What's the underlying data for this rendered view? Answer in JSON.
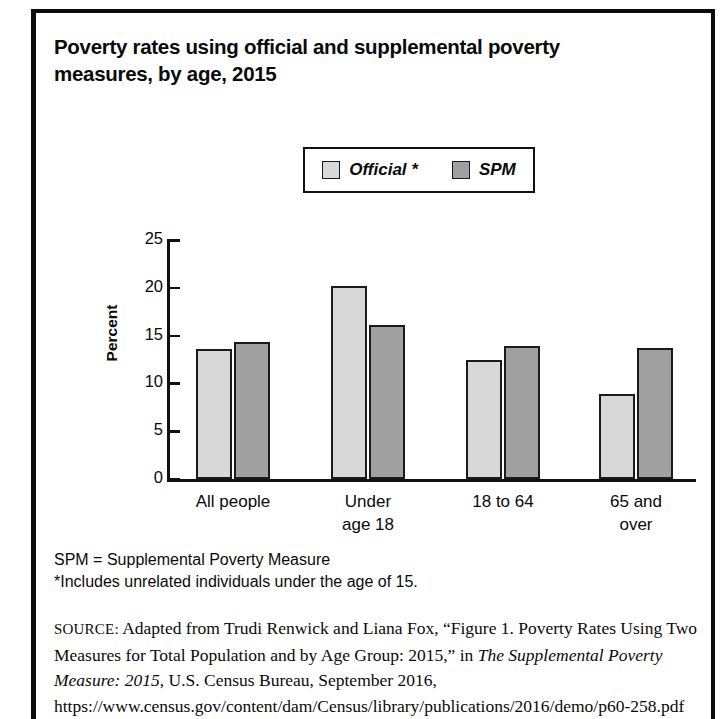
{
  "figure": {
    "title": "Poverty rates using official and supplemental poverty measures, by age, 2015"
  },
  "legend": {
    "items": [
      {
        "label": "Official *",
        "color": "#d8d8d8",
        "name": "official"
      },
      {
        "label": "SPM",
        "color": "#a0a0a0",
        "name": "spm"
      }
    ]
  },
  "notes": {
    "abbreviation": "SPM = Supplemental Poverty Measure",
    "footnote": "*Includes unrelated individuals under the age of 15."
  },
  "source": {
    "label": "SOURCE:",
    "text_before_italic": " Adapted from Trudi Renwick and Liana Fox, “Figure 1. Poverty Rates Using Two Measures for Total Population and by Age Group: 2015,” in ",
    "italic_title": "The Supplemental Poverty Measure: 2015",
    "text_after_italic": ", U.S. Census Bureau, September 2016, https://www.census.gov/content/dam/Census/library/publications/2016/demo/p60-258.pdf (accessed August"
  },
  "chart_data": {
    "type": "bar",
    "title": "Poverty rates using official and supplemental poverty measures, by age, 2015",
    "xlabel": "",
    "ylabel": "Percent",
    "ylim": [
      0,
      25
    ],
    "yticks": [
      0,
      5,
      10,
      15,
      20,
      25
    ],
    "ytick_labels": [
      "0",
      "5",
      "10",
      "15",
      "20",
      "25"
    ],
    "grid": false,
    "legend_position": "top-center",
    "categories": [
      "All people",
      "Under age 18",
      "18 to 64",
      "65 and over"
    ],
    "category_lines": [
      [
        "All people"
      ],
      [
        "Under",
        "age 18"
      ],
      [
        "18 to 64"
      ],
      [
        "65 and",
        "over"
      ]
    ],
    "series": [
      {
        "name": "Official *",
        "color": "#d8d8d8",
        "values": [
          13.6,
          20.2,
          12.4,
          8.9
        ]
      },
      {
        "name": "SPM",
        "color": "#a0a0a0",
        "values": [
          14.3,
          16.1,
          13.9,
          13.7
        ]
      }
    ]
  }
}
